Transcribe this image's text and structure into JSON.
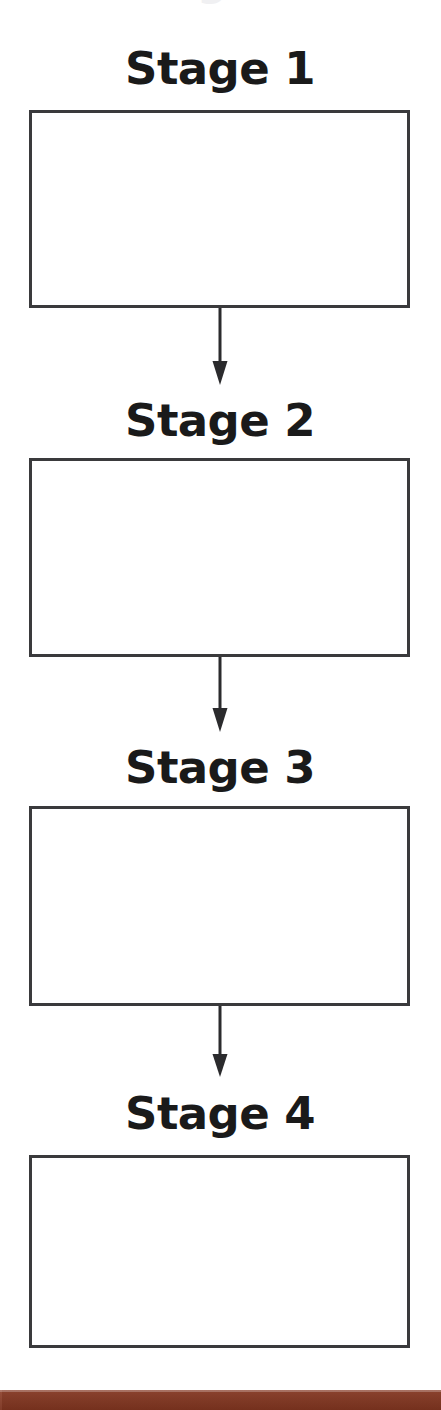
{
  "page": {
    "background_color": "#ffffff",
    "width": 441,
    "height": 1410,
    "clipped_top_heading": "the stage below"
  },
  "diagram": {
    "orientation": "vertical",
    "box_border_color": "#3a3a3c",
    "label_color": "#1a1a1a",
    "arrow_color": "#2b2b2d",
    "stages": [
      {
        "label": "Stage 1",
        "content": ""
      },
      {
        "label": "Stage 2",
        "content": ""
      },
      {
        "label": "Stage 3",
        "content": ""
      },
      {
        "label": "Stage 4",
        "content": ""
      }
    ],
    "connectors": [
      {
        "from": "Stage 1",
        "to": "Stage 2",
        "type": "down-arrow"
      },
      {
        "from": "Stage 2",
        "to": "Stage 3",
        "type": "down-arrow"
      },
      {
        "from": "Stage 3",
        "to": "Stage 4",
        "type": "down-arrow"
      }
    ]
  },
  "footer": {
    "accent_color": "#8b3a23",
    "label": ""
  }
}
